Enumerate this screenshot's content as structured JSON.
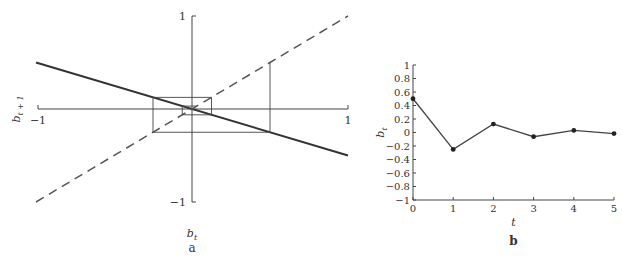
{
  "chart_data": [
    {
      "type": "line",
      "panel_label": "a",
      "title": "",
      "xlabel": "b_t",
      "ylabel": "b_{t+1}",
      "xlim": [
        -1,
        1
      ],
      "ylim": [
        -1,
        1
      ],
      "x_tick_labels": [
        "−1",
        "1"
      ],
      "y_tick_labels": [
        "1",
        "−1"
      ],
      "grid": false,
      "series": [
        {
          "name": "map",
          "style": "solid",
          "x": [
            -1,
            1
          ],
          "values": [
            0.5,
            -0.5
          ]
        },
        {
          "name": "45-degree line",
          "style": "dashed",
          "x": [
            -1,
            1
          ],
          "values": [
            -1,
            1
          ]
        }
      ],
      "cobweb_b": [
        0.5,
        -0.25,
        0.125,
        -0.0625,
        0.03125
      ]
    },
    {
      "type": "line",
      "panel_label": "b",
      "title": "",
      "xlabel": "t",
      "ylabel": "b_t",
      "xlim": [
        0,
        5
      ],
      "ylim": [
        -1,
        1
      ],
      "x_ticks": [
        0,
        1,
        2,
        3,
        4,
        5
      ],
      "y_ticks": [
        1,
        0.8,
        0.6,
        0.4,
        0.2,
        0,
        -0.2,
        -0.4,
        -0.6,
        -0.8,
        -1
      ],
      "y_tick_labels": [
        "1",
        "0.8",
        "0.6",
        "0.4",
        "0.2",
        "0",
        "−0.2",
        "−0.4",
        "−0.6",
        "−0.8",
        "−1"
      ],
      "grid": false,
      "x": [
        0,
        1,
        2,
        3,
        4,
        5
      ],
      "values": [
        0.5,
        -0.25,
        0.125,
        -0.0625,
        0.03125,
        -0.015625
      ]
    }
  ]
}
